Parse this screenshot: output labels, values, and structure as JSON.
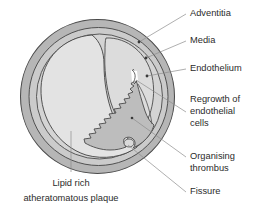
{
  "figure": {
    "background_color": "#ffffff"
  },
  "colors": {
    "adventitia_fill": "#b6b6b6",
    "media_fill": "#cfcfcf",
    "lumen_fill": "#dcdcdc",
    "plaque_fill": "#e4e4e4",
    "thrombus_fill": "#bdbdbd",
    "outline": "#4a4a4a",
    "leader_line": "#8d8d8d",
    "text": "#2b2b2b"
  },
  "structures": [
    {
      "name": "adventitia",
      "label": "Adventitia"
    },
    {
      "name": "media",
      "label": "Media"
    },
    {
      "name": "endothelium",
      "label": "Endothelium"
    },
    {
      "name": "regrowth-endothelial-cells",
      "label": "Regrowth of endothelial cells"
    },
    {
      "name": "organising-thrombus",
      "label": "Organising thrombus"
    },
    {
      "name": "fissure",
      "label": "Fissure"
    },
    {
      "name": "lipid-plaque",
      "label": "Lipid rich atheratomatous plaque"
    }
  ],
  "labels": {
    "adventitia": "Adventitia",
    "media": "Media",
    "endothelium": "Endothelium",
    "regrowth_line1": "Regrowth of",
    "regrowth_line2": "endothelial",
    "regrowth_line3": "cells",
    "organising_line1": "Organising",
    "organising_line2": "thrombus",
    "fissure": "Fissure",
    "plaque_line1": "Lipid rich",
    "plaque_line2": "atheratomatous plaque"
  }
}
